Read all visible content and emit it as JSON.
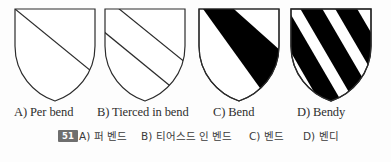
{
  "figure": {
    "background_color": "#fdfdfd",
    "stroke_color": "#2b2b2b",
    "fill_black": "#000000",
    "fill_white": "#ffffff"
  },
  "shields": [
    {
      "key": "per-bend",
      "letter": "A",
      "pattern": "per-bend",
      "description": "shield divided by one diagonal line from dexter chief to sinister base",
      "line_count": 1,
      "black_bands": 0
    },
    {
      "key": "tierced-in-bend",
      "letter": "B",
      "pattern": "tierced-in-bend",
      "description": "shield divided by two parallel diagonal lines into three parts",
      "line_count": 2,
      "black_bands": 0
    },
    {
      "key": "bend",
      "letter": "C",
      "pattern": "bend",
      "description": "single broad black diagonal band across a white shield",
      "line_count": 0,
      "black_bands": 1
    },
    {
      "key": "bendy",
      "letter": "D",
      "pattern": "bendy",
      "description": "shield of alternating black and white diagonal bands",
      "line_count": 0,
      "black_bands": 4
    }
  ],
  "captions_en": [
    {
      "label": "A) Per bend"
    },
    {
      "label": "B) Tierced in bend"
    },
    {
      "label": "C) Bend"
    },
    {
      "label": "D) Bendy"
    }
  ],
  "answer_row": {
    "question_number": "51",
    "options": [
      {
        "label": "A) 퍼 벤드"
      },
      {
        "label": "B) 티어스드 인 벤드"
      },
      {
        "label": "C) 벤드"
      },
      {
        "label": "D) 벤디"
      }
    ]
  }
}
